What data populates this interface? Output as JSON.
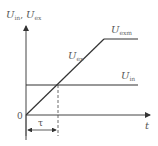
{
  "diagram": {
    "type": "voltage-time graph",
    "y_axis_label": {
      "main": "U",
      "sub1": "in",
      "sep": ", ",
      "main2": "U",
      "sub2": "ex"
    },
    "x_axis_label": "t",
    "origin_label": "0",
    "curves": [
      {
        "id": "U_exm",
        "label_main": "U",
        "label_sub": "exm",
        "description": "plateau (max) level"
      },
      {
        "id": "U_ex",
        "label_main": "U",
        "label_sub": "ex",
        "description": "linear ramp from origin"
      },
      {
        "id": "U_in",
        "label_main": "U",
        "label_sub": "in",
        "description": "constant input level"
      }
    ],
    "interval_label": "τ",
    "colors": {
      "line": "#333333",
      "axis": "#444444",
      "text": "#555555",
      "dash": "#444444"
    }
  }
}
